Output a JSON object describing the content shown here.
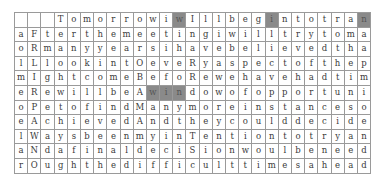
{
  "puzzle": {
    "columns": 27,
    "highlight_color": "#8a8a8a",
    "border_color": "#9a9a9a",
    "rows": [
      {
        "cells": [
          "",
          "",
          "",
          "T",
          "o",
          "m",
          "o",
          "r",
          "r",
          "o",
          "w",
          "i",
          "w",
          "I",
          "l",
          "l",
          "b",
          "e",
          "g",
          "i",
          "n",
          "t",
          "o",
          "t",
          "r",
          "a",
          "n"
        ],
        "highlighted": [
          12,
          19,
          26
        ]
      },
      {
        "cells": [
          "a",
          "F",
          "t",
          "e",
          "r",
          "t",
          "h",
          "e",
          "m",
          "e",
          "e",
          "t",
          "i",
          "n",
          "g",
          "i",
          "w",
          "i",
          "l",
          "l",
          "t",
          "r",
          "y",
          "t",
          "o",
          "m",
          "a"
        ],
        "highlighted": []
      },
      {
        "cells": [
          "o",
          "R",
          "m",
          "a",
          "n",
          "y",
          "y",
          "e",
          "a",
          "r",
          "s",
          "i",
          "h",
          "a",
          "v",
          "e",
          "b",
          "e",
          "l",
          "i",
          "e",
          "v",
          "e",
          "d",
          "t",
          "h",
          "a"
        ],
        "highlighted": []
      },
      {
        "cells": [
          "l",
          "L",
          "l",
          "o",
          "o",
          "k",
          "i",
          "n",
          "t",
          "O",
          "e",
          "v",
          "e",
          "R",
          "y",
          "a",
          "s",
          "p",
          "e",
          "c",
          "t",
          "o",
          "f",
          "t",
          "h",
          "e",
          "p"
        ],
        "highlighted": []
      },
      {
        "cells": [
          "m",
          "I",
          "g",
          "h",
          "t",
          "c",
          "o",
          "m",
          "e",
          "B",
          "e",
          "f",
          "o",
          "R",
          "e",
          "w",
          "e",
          "h",
          "a",
          "v",
          "e",
          "h",
          "a",
          "d",
          "t",
          "i",
          "m"
        ],
        "highlighted": []
      },
      {
        "cells": [
          "e",
          "R",
          "e",
          "w",
          "i",
          "l",
          "l",
          "b",
          "e",
          "A",
          "w",
          "i",
          "n",
          "d",
          "o",
          "w",
          "o",
          "f",
          "o",
          "p",
          "p",
          "o",
          "r",
          "t",
          "u",
          "n",
          "i"
        ],
        "highlighted": [
          10,
          11,
          12
        ]
      },
      {
        "cells": [
          "o",
          "P",
          "e",
          "t",
          "o",
          "f",
          "i",
          "n",
          "d",
          "M",
          "a",
          "n",
          "y",
          "m",
          "o",
          "r",
          "e",
          "i",
          "n",
          "s",
          "t",
          "a",
          "n",
          "c",
          "e",
          "s",
          "o"
        ],
        "highlighted": []
      },
      {
        "cells": [
          "e",
          "A",
          "c",
          "h",
          "i",
          "e",
          "v",
          "e",
          "d",
          "A",
          "n",
          "d",
          "t",
          "h",
          "e",
          "y",
          "c",
          "o",
          "u",
          "l",
          "d",
          "d",
          "e",
          "c",
          "i",
          "d",
          "e"
        ],
        "highlighted": []
      },
      {
        "cells": [
          "l",
          "W",
          "a",
          "y",
          "s",
          "b",
          "e",
          "e",
          "n",
          "m",
          "y",
          "i",
          "n",
          "T",
          "e",
          "n",
          "t",
          "i",
          "o",
          "n",
          "t",
          "o",
          "t",
          "r",
          "y",
          "a",
          "n"
        ],
        "highlighted": []
      },
      {
        "cells": [
          "a",
          "N",
          "d",
          "a",
          "f",
          "i",
          "n",
          "a",
          "l",
          "d",
          "e",
          "c",
          "i",
          "S",
          "i",
          "o",
          "n",
          "w",
          "o",
          "u",
          "l",
          "b",
          "e",
          "n",
          "e",
          "e",
          "d"
        ],
        "highlighted": []
      },
      {
        "cells": [
          "r",
          "O",
          "u",
          "g",
          "h",
          "t",
          "h",
          "e",
          "d",
          "i",
          "f",
          "f",
          "i",
          "c",
          "u",
          "l",
          "t",
          "t",
          "i",
          "m",
          "e",
          "s",
          "a",
          "h",
          "e",
          "a",
          "d"
        ],
        "highlighted": []
      }
    ]
  }
}
